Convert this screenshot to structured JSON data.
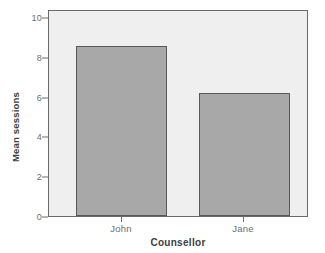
{
  "chart_data": {
    "type": "bar",
    "title": "",
    "categories": [
      "John",
      "Jane"
    ],
    "values": [
      8.55,
      6.18
    ],
    "xlabel": "Counsellor",
    "ylabel": "Mean sessions",
    "ylim": [
      0,
      10
    ],
    "yticks": [
      "0",
      "2",
      "4",
      "6",
      "8",
      "10"
    ],
    "ytick_values": [
      0,
      2,
      4,
      6,
      8,
      10
    ],
    "grid": false,
    "legend": "none",
    "series": [
      {
        "name": "Mean sessions",
        "values": [
          8.55,
          6.18
        ]
      }
    ]
  },
  "style": {
    "bar_fill": "#a8a8a8",
    "bar_border": "#585858",
    "plot_background": "#efefef",
    "plot_border": "#6a6a6a",
    "figure_background": "#ffffff",
    "tick_label_color": "#6d6d6d",
    "axis_title_color": "#3d3d3d"
  }
}
